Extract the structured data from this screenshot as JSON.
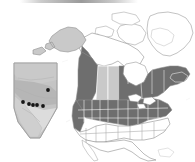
{
  "figure": {
    "kind": "distribution-map",
    "caption": "",
    "background_color": "#ffffff",
    "artifacts": {
      "top_scan_smudge": "present"
    }
  },
  "colors": {
    "shaded_range": "#6e6e6e",
    "light_range": "#c9c9c9",
    "unshaded": "#ffffff",
    "outline": "#8a8a8a",
    "inner_border": "#ffffff",
    "point_marker": "#151515",
    "inset_fill_light": "#c4c4c4",
    "inset_fill_mid": "#b0b0b0",
    "inset_fill_pale": "#dcdcdc"
  },
  "main_map": {
    "name": "north-america-map",
    "regions": [
      {
        "id": "greenland",
        "label": "Greenland",
        "fill": "unshaded"
      },
      {
        "id": "alaska",
        "label": "Alaska",
        "fill": "light_range"
      },
      {
        "id": "yukon-nwt-nunavut",
        "label": "Northern Territories",
        "fill": "unshaded"
      },
      {
        "id": "british-columbia",
        "label": "British Columbia",
        "fill": "shaded_range"
      },
      {
        "id": "alberta",
        "label": "Alberta",
        "fill": "light_range"
      },
      {
        "id": "saskatchewan",
        "label": "Saskatchewan",
        "fill": "light_range"
      },
      {
        "id": "manitoba-ontario-quebec-atlantic",
        "label": "Eastern Canada",
        "fill": "shaded_range"
      },
      {
        "id": "northern-united-states",
        "label": "Northern United States",
        "fill": "shaded_range"
      },
      {
        "id": "southern-united-states",
        "label": "Southern United States",
        "fill": "unshaded"
      },
      {
        "id": "mexico",
        "label": "Mexico",
        "fill": "unshaded"
      }
    ]
  },
  "inset_map": {
    "name": "alberta-inset-map",
    "label": "Alberta",
    "sampling_sites": [
      {
        "id": "site-1",
        "x": 23,
        "y": 102
      },
      {
        "id": "site-2",
        "x": 29,
        "y": 104
      },
      {
        "id": "site-3",
        "x": 33,
        "y": 105
      },
      {
        "id": "site-4",
        "x": 37,
        "y": 105
      },
      {
        "id": "site-5",
        "x": 43,
        "y": 106
      },
      {
        "id": "site-6",
        "x": 48,
        "y": 90
      }
    ],
    "sampling_site_count": 6
  }
}
